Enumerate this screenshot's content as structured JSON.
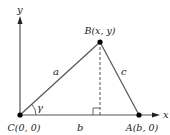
{
  "diagram": {
    "type": "geometry-triangle",
    "axes": {
      "x_label": "x",
      "y_label": "y"
    },
    "points": {
      "C": {
        "label": "C(0, 0)",
        "x": 20,
        "y": 115
      },
      "B": {
        "label": "B(x, y)",
        "x": 100,
        "y": 42
      },
      "A": {
        "label": "A(b, 0)",
        "x": 139,
        "y": 115
      }
    },
    "sides": {
      "a": "a",
      "b": "b",
      "c": "c"
    },
    "angle": "γ",
    "colors": {
      "line": "#555555",
      "point": "#000000",
      "text": "#222222"
    }
  }
}
